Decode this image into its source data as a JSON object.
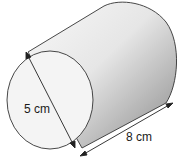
{
  "figure": {
    "shape": "cylinder",
    "diameter_label": "5 cm",
    "length_label": "8 cm"
  },
  "colors": {
    "outline": "#333333",
    "face_fill": "#f4f4f4",
    "body_light": "#f7f7f7",
    "body_dark": "#8c8c8c"
  }
}
